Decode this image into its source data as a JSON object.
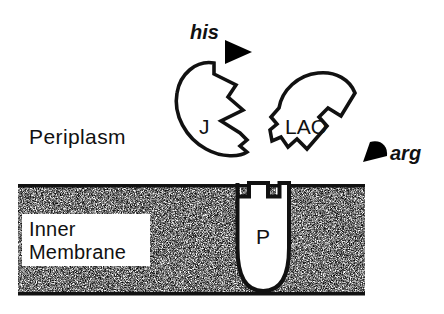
{
  "figure": {
    "width": 444,
    "height": 314,
    "background_color": "#ffffff",
    "ink_color": "#111111"
  },
  "labels": {
    "periplasm": "Periplasm",
    "inner_membrane_line1": "Inner",
    "inner_membrane_line2": "Membrane",
    "his": "his",
    "arg": "arg",
    "binding_protein_j": "J",
    "binding_protein_lao": "LAO",
    "permease_p": "P"
  },
  "shapes": {
    "membrane": {
      "name": "inner-membrane-band",
      "fill": "stipple-texture",
      "border_color": "#111111",
      "x": 18,
      "y": 185,
      "width": 347,
      "height": 110
    },
    "j_protein": {
      "name": "j-binding-protein",
      "description": "open circular binding protein with wedge cleft on right",
      "fill": "#ffffff",
      "stroke": "#111111"
    },
    "lao_protein": {
      "name": "lao-binding-protein",
      "description": "open binding protein with cleft on right and zigzag tail at lower left",
      "fill": "#ffffff",
      "stroke": "#111111"
    },
    "p_permease": {
      "name": "p-membrane-permease",
      "description": "U-shaped membrane permease with rectangular notch at top",
      "fill": "#ffffff",
      "stroke": "#111111"
    },
    "his_ligand": {
      "name": "his-ligand-marker",
      "description": "solid black right-pointing triangle",
      "fill": "#000000"
    },
    "arg_ligand": {
      "name": "arg-ligand-marker",
      "description": "solid black quarter-pie wedge",
      "fill": "#000000"
    }
  }
}
